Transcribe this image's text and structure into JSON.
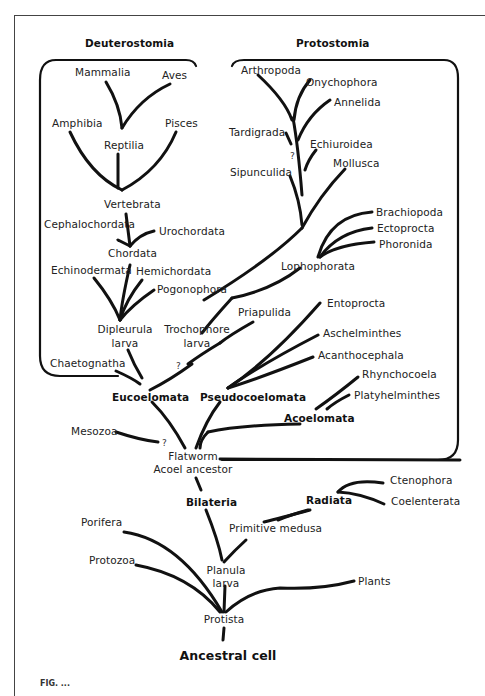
{
  "diagram": {
    "type": "phylogenetic-tree",
    "group_headers": {
      "deuterostomia": "Deuterostomia",
      "protostomia": "Protostomia"
    },
    "deuterostomia_taxa": {
      "mammalia": "Mammalia",
      "aves": "Aves",
      "amphibia": "Amphibia",
      "pisces": "Pisces",
      "reptilia": "Reptilia",
      "vertebrata": "Vertebrata",
      "cephalochordata": "Cephalochordata",
      "urochordata": "Urochordata",
      "chordata": "Chordata",
      "echinodermata": "Echinodermata",
      "hemichordata": "Hemichordata",
      "pogonophora": "Pogonophora",
      "dipleurula_1": "Dipleurula",
      "dipleurula_2": "larva",
      "chaetognatha": "Chaetognatha"
    },
    "protostomia_taxa": {
      "arthropoda": "Arthropoda",
      "onychophora": "Onychophora",
      "annelida": "Annelida",
      "tardigrada": "Tardigrada",
      "echiuroidea": "Echiuroidea",
      "mollusca": "Mollusca",
      "sipunculida": "Sipunculida",
      "brachiopoda": "Brachiopoda",
      "ectoprocta": "Ectoprocta",
      "phoronida": "Phoronida",
      "lophophorata": "Lophophorata",
      "trochophore_1": "Trochophore",
      "trochophore_2": "larva",
      "priapulida": "Priapulida",
      "entoprocta": "Entoprocta",
      "aschelminthes": "Aschelminthes",
      "acanthocephala": "Acanthocephala",
      "rhynchocoela": "Rhynchocoela",
      "platyhelminthes": "Platyhelminthes"
    },
    "major_groups": {
      "eucoelomata": "Eucoelomata",
      "pseudocoelomata": "Pseudocoelomata",
      "acoelomata": "Acoelomata",
      "bilateria": "Bilateria",
      "radiata": "Radiata"
    },
    "lower_taxa": {
      "mesozoa": "Mesozoa",
      "flatworm": "Flatworm",
      "acoel_ancestor": "Acoel ancestor",
      "ctenophora": "Ctenophora",
      "coelenterata": "Coelenterata",
      "primitive_medusa": "Primitive medusa",
      "porifera": "Porifera",
      "protozoa": "Protozoa",
      "planula_1": "Planula",
      "planula_2": "larva",
      "plants": "Plants",
      "protista": "Protista",
      "ancestral_cell": "Ancestral cell"
    },
    "uncertainty_marks": {
      "tardigrada_q": "?",
      "trochophore_q": "?",
      "mesozoa_q": "?"
    },
    "caption_fragment": "FIG. ..."
  }
}
